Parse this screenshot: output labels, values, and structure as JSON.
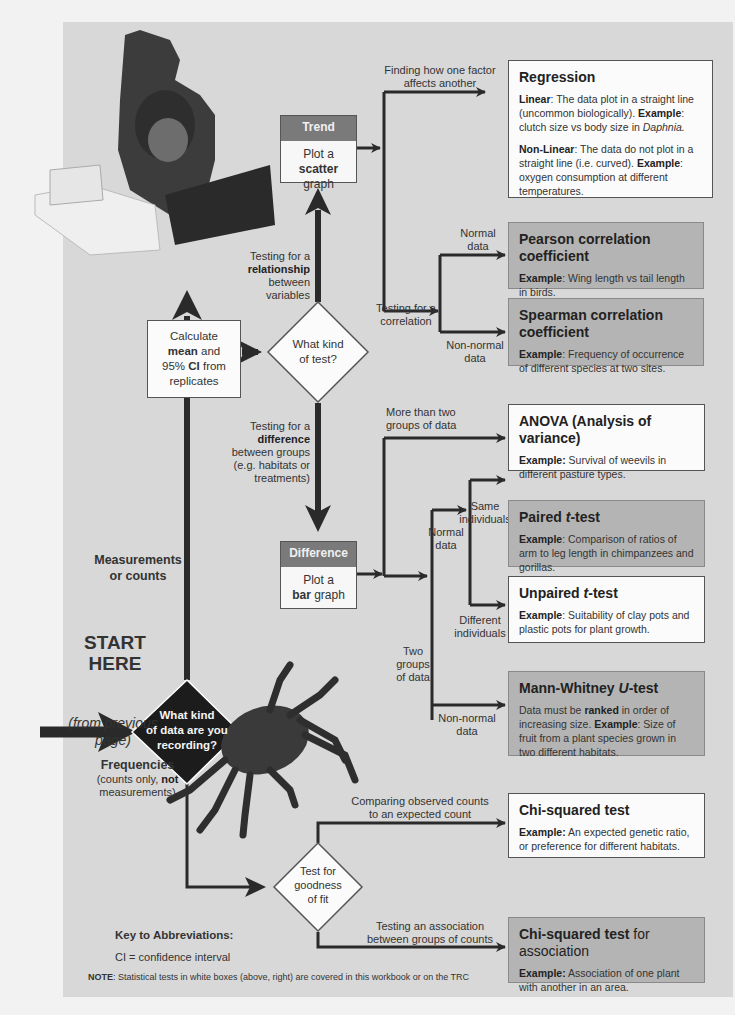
{
  "start": {
    "title_line1": "START",
    "title_line2": "HERE",
    "from_line1": "(from previous",
    "from_line2": "page)"
  },
  "root_question": {
    "line1": "What kind",
    "line2": "of data are you",
    "line3": "recording?"
  },
  "branch_measurements": {
    "line1": "Measurements",
    "line2": "or counts"
  },
  "branch_frequencies": {
    "title": "Frequencies",
    "line2_pre": "(counts only, ",
    "line2_bold": "not",
    "line3": "measurements)"
  },
  "calculate_box": {
    "line1": "Calculate",
    "line2_bold": "mean",
    "line2_rest": " and",
    "line3_pre": "95% ",
    "line3_bold": "CI",
    "line3_rest": " from",
    "line4": "replicates"
  },
  "test_question": {
    "line1": "What kind",
    "line2": "of test?"
  },
  "relationship_label": {
    "line1": "Testing for a",
    "line2_bold": "relationship",
    "line3": "between",
    "line4": "variables"
  },
  "difference_label": {
    "line1": "Testing for a",
    "line2_bold": "difference",
    "line3": "between groups",
    "line4": "(e.g. habitats or",
    "line5": "treatments)"
  },
  "trend_box": {
    "header": "Trend",
    "line1": "Plot a",
    "line2_bold": "scatter",
    "line2_rest": " graph"
  },
  "difference_box": {
    "header": "Difference",
    "line1": "Plot a",
    "line2_bold": "bar",
    "line2_rest": " graph"
  },
  "edge_labels": {
    "finding_factor_1": "Finding how one factor",
    "finding_factor_2": "affects another",
    "correlation_1": "Testing for a",
    "correlation_2": "correlation",
    "normal_1": "Normal",
    "normal_2": "data",
    "nonnormal_1": "Non-normal",
    "nonnormal_2": "data",
    "more_two_1": "More than two",
    "more_two_2": "groups of data",
    "two_groups_1": "Two",
    "two_groups_2": "groups",
    "two_groups_3": "of data",
    "normal_b1": "Normal",
    "normal_b2": "data",
    "same_ind_1": "Same",
    "same_ind_2": "individuals",
    "diff_ind_1": "Different",
    "diff_ind_2": "individuals",
    "nonnormal_b1": "Non-normal",
    "nonnormal_b2": "data",
    "compare_obs_1": "Comparing observed counts",
    "compare_obs_2": "to an expected count",
    "assoc_1": "Testing an association",
    "assoc_2": "between groups of counts"
  },
  "goodness_question": {
    "line1": "Test for",
    "line2": "goodness",
    "line3": "of fit"
  },
  "tests": {
    "regression": {
      "title": "Regression",
      "linear_label": "Linear",
      "linear_text": ":  The data plot in a straight line (uncommon biologically).  ",
      "linear_example_label": "Example",
      "linear_example": ": clutch size vs body size in ",
      "linear_example_italic": "Daphnia.",
      "nonlinear_label": "Non-Linear",
      "nonlinear_text": ":  The data do not plot in a straight line (i.e. curved). ",
      "nonlinear_example_label": "Example",
      "nonlinear_example": ": oxygen consumption at different temperatures."
    },
    "pearson": {
      "title": "Pearson correlation coefficient",
      "example_label": "Example",
      "example": ": Wing length vs tail length in birds."
    },
    "spearman": {
      "title": "Spearman correlation coefficient",
      "example_label": "Example",
      "example": ": Frequency of occurrence of different species at two sites."
    },
    "anova": {
      "title": "ANOVA (Analysis of variance)",
      "example_label": "Example:",
      "example": " Survival of weevils in different pasture types."
    },
    "paired": {
      "title_pre": "Paired ",
      "title_italic": "t",
      "title_post": "-test",
      "example_label": "Example",
      "example": ": Comparison of ratios of arm to leg length in chimpanzees and gorillas."
    },
    "unpaired": {
      "title_pre": "Unpaired ",
      "title_italic": "t",
      "title_post": "-test",
      "example_label": "Example",
      "example": ": Suitability of clay pots and plastic pots for plant growth."
    },
    "mann_whitney": {
      "title_pre": "Mann-Whitney ",
      "title_italic": "U",
      "title_post": "-test",
      "text_pre": "Data must be ",
      "text_bold": "ranked",
      "text_post": " in order of increasing size.  ",
      "example_label": "Example",
      "example": ": Size of fruit from a plant species grown in two different habitats."
    },
    "chi_squared": {
      "title": "Chi-squared test",
      "example_label": "Example:",
      "example": " An expected genetic ratio, or preference for different habitats."
    },
    "chi_association": {
      "title_bold": "Chi-squared test",
      "title_rest": " for association",
      "example_label": "Example:",
      "example": " Association of one plant with another in an area."
    }
  },
  "key": {
    "title": "Key to Abbreviations:",
    "entry": "CI  = confidence interval"
  },
  "note": {
    "label": "NOTE",
    "text": ": Statistical tests in white boxes (above, right) are covered in this workbook or on the TRC"
  },
  "colors": {
    "panel_bg": "#d8d8d8",
    "white_box": "#fbfbfb",
    "grey_box": "#b4b4b4",
    "header_fill": "#7a7a7a",
    "line": "#2a2a2a"
  }
}
